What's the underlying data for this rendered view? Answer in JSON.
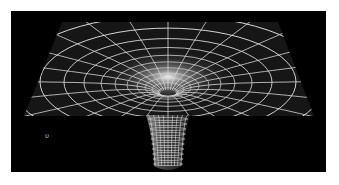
{
  "figure": {
    "background_color": "#000000",
    "page_color": "#ffffff",
    "grid_color": "#d8d8d8",
    "glow_color": "#ffffff",
    "mark_text": "υ",
    "frame": {
      "x": 11,
      "y": 11,
      "width": 315,
      "height": 161
    },
    "plane": {
      "top_left": [
        51,
        11
      ],
      "top_right": [
        267,
        11
      ],
      "bottom_left": [
        13,
        105
      ],
      "bottom_right": [
        303,
        105
      ]
    },
    "well_center": [
      157,
      69
    ],
    "throat": {
      "top_y": 104,
      "bottom_y": 161,
      "half_width_top": 22,
      "half_width_bottom": 14
    }
  }
}
